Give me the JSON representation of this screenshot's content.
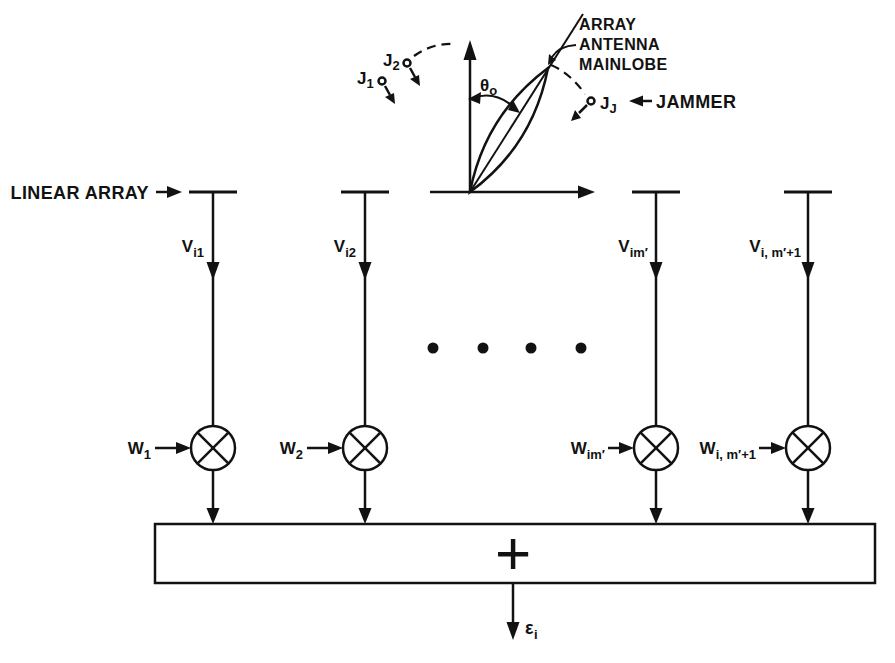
{
  "figure": {
    "colors": {
      "ink": "#121212",
      "background": "#ffffff"
    },
    "antenna": {
      "mainlobe_label": {
        "line1": "ARRAY",
        "line2": "ANTENNA",
        "line3": "MAINLOBE"
      },
      "boresight_angle": {
        "base": "θ",
        "sub": "o"
      },
      "jammers": {
        "j1": {
          "base": "J",
          "sub": "1"
        },
        "j2": {
          "base": "J",
          "sub": "2"
        },
        "jj": {
          "base": "J",
          "sub": "J"
        },
        "label": "JAMMER"
      }
    },
    "array_label": "LINEAR ARRAY",
    "channels": [
      {
        "signal": {
          "base": "V",
          "sub": "i1"
        },
        "weight": {
          "base": "W",
          "sub": "1"
        }
      },
      {
        "signal": {
          "base": "V",
          "sub": "i2"
        },
        "weight": {
          "base": "W",
          "sub": "2"
        }
      },
      {
        "signal": {
          "base": "V",
          "sub": "im′"
        },
        "weight": {
          "base": "W",
          "sub": "im′"
        }
      },
      {
        "signal": {
          "base": "V",
          "sub": "i, m′+1"
        },
        "weight": {
          "base": "W",
          "sub": "i, m′+1"
        }
      }
    ],
    "ellipsis_dot_count": 4,
    "summer": {
      "symbol": "+"
    },
    "output": {
      "base": "ε",
      "sub": "i"
    }
  }
}
